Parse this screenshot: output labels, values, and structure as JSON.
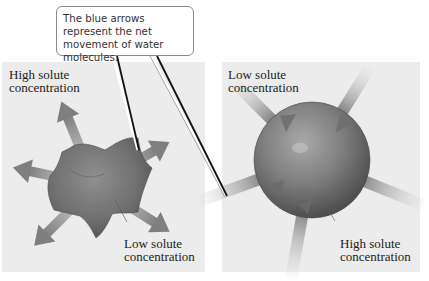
{
  "callout": {
    "text": "The blue arrows represent the net movement of water molecules."
  },
  "left_panel": {
    "top_label_line1": "High solute",
    "top_label_line2": "concentration",
    "inner_label_line1": "Low solute",
    "inner_label_line2": "concentration",
    "shape": "shrunken-cell",
    "arrow_direction": "outward",
    "arrow_count": 6
  },
  "right_panel": {
    "top_label_line1": "Low solute",
    "top_label_line2": "concentration",
    "inner_label_line1": "High solute",
    "inner_label_line2": "concentration",
    "shape": "swollen-cell",
    "arrow_direction": "inward",
    "arrow_count": 5
  },
  "colors": {
    "panel_bg": "#ececec",
    "cell_fill": "#7a7a7a",
    "arrow": "#8c8c8c",
    "leader_line": "#111111"
  }
}
